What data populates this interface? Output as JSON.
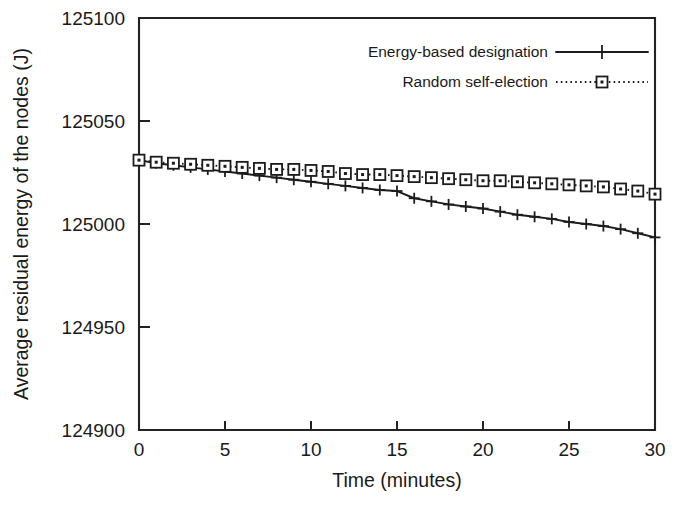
{
  "chart_data": {
    "type": "line",
    "title": "",
    "xlabel": "Time (minutes)",
    "ylabel": "Average residual energy of the nodes (J)",
    "xlim": [
      0,
      30
    ],
    "ylim": [
      124900,
      125100
    ],
    "xticks": [
      "0",
      "5",
      "10",
      "15",
      "20",
      "25",
      "30"
    ],
    "xtick_values": [
      0,
      5,
      10,
      15,
      20,
      25,
      30
    ],
    "yticks": [
      "124900",
      "124950",
      "125000",
      "125050",
      "125100"
    ],
    "ytick_values": [
      124900,
      124950,
      125000,
      125050,
      125100
    ],
    "grid": false,
    "legend_position": "top-right",
    "x": [
      0,
      1,
      2,
      3,
      4,
      5,
      6,
      7,
      8,
      9,
      10,
      11,
      12,
      13,
      14,
      15,
      16,
      17,
      18,
      19,
      20,
      21,
      22,
      23,
      24,
      25,
      26,
      27,
      28,
      29,
      30
    ],
    "series": [
      {
        "name": "Energy-based designation",
        "marker": "plus",
        "linestyle": "solid",
        "values": [
          125031,
          125029.5,
          125028.5,
          125027.5,
          125026.5,
          125025.5,
          125024.5,
          125023.5,
          125022.5,
          125021.5,
          125020.5,
          125019.5,
          125018.5,
          125017.5,
          125016.5,
          125016,
          125012.5,
          125011,
          125009.5,
          125008.5,
          125007.5,
          125006,
          125004.5,
          125003.5,
          125002.5,
          125001,
          125000,
          124999,
          124997.5,
          124995.5,
          124993.5
        ]
      },
      {
        "name": "Random self-election",
        "marker": "square",
        "linestyle": "dotted",
        "values": [
          125031,
          125030,
          125029.5,
          125029,
          125028.5,
          125028,
          125027.5,
          125027,
          125026.5,
          125026.5,
          125026,
          125025.5,
          125024.5,
          125024,
          125024,
          125023.5,
          125023,
          125022.5,
          125022,
          125021.5,
          125021,
          125021,
          125020.5,
          125020,
          125019.5,
          125019,
          125018.5,
          125018,
          125017,
          125016,
          125014.5
        ]
      }
    ]
  },
  "legend": {
    "entries": [
      {
        "label": "Energy-based designation"
      },
      {
        "label": "Random self-election"
      }
    ]
  }
}
